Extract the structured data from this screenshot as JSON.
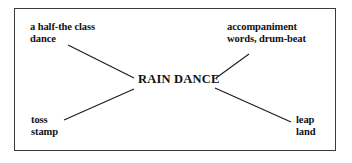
{
  "diagram": {
    "type": "spider-web-word-map",
    "frame": {
      "border_color": "#3a3a3a",
      "background_color": "#ffffff"
    },
    "center": {
      "label": "RAIN DANCE"
    },
    "branches": [
      {
        "id": "top-left",
        "lines": [
          "a half-the class",
          "dance"
        ]
      },
      {
        "id": "top-right",
        "lines": [
          "accompaniment",
          "words, drum-beat"
        ]
      },
      {
        "id": "bottom-left",
        "lines": [
          "toss",
          "stamp"
        ]
      },
      {
        "id": "bottom-right",
        "lines": [
          "leap",
          "land"
        ]
      }
    ],
    "connectors": [
      {
        "id": "connector-top-left",
        "x1": 68,
        "y1": 45,
        "x2": 134,
        "y2": 78,
        "color": "#1a1a1a"
      },
      {
        "id": "connector-top-right",
        "x1": 216,
        "y1": 78,
        "x2": 249,
        "y2": 54,
        "color": "#1a1a1a"
      },
      {
        "id": "connector-bottom-left",
        "x1": 64,
        "y1": 120,
        "x2": 134,
        "y2": 89,
        "color": "#1a1a1a"
      },
      {
        "id": "connector-bottom-right",
        "x1": 215,
        "y1": 88,
        "x2": 291,
        "y2": 122,
        "color": "#1a1a1a"
      }
    ]
  }
}
